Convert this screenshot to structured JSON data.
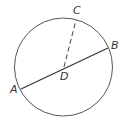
{
  "diagram": {
    "type": "geometry-circle",
    "circle": {
      "cx": 63.5,
      "cy": 67,
      "r": 49,
      "stroke": "#555555"
    },
    "segments": [
      {
        "name": "AB",
        "from": "A",
        "to": "B",
        "style": "solid",
        "stroke": "#333333"
      },
      {
        "name": "DC",
        "from": "D",
        "to": "C",
        "style": "dashed",
        "stroke": "#444444"
      }
    ],
    "points": {
      "A": {
        "label": "A",
        "x": 21,
        "y": 89,
        "label_x": 10,
        "label_y": 93
      },
      "B": {
        "label": "B",
        "x": 108,
        "y": 48,
        "label_x": 111,
        "label_y": 49
      },
      "C": {
        "label": "C",
        "x": 76,
        "y": 20,
        "label_x": 73,
        "label_y": 14
      },
      "D": {
        "label": "D",
        "x": 64,
        "y": 67,
        "label_x": 60,
        "label_y": 80
      }
    }
  }
}
